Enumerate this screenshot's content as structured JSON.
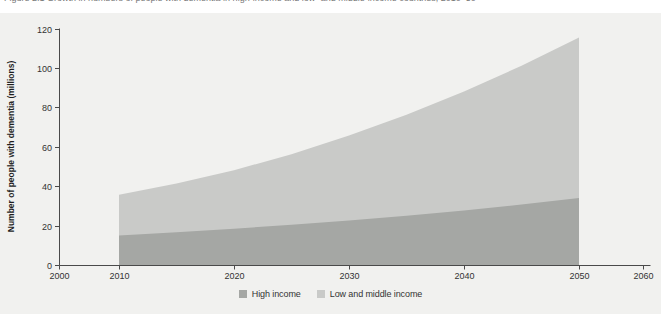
{
  "figure": {
    "clipped_caption": "Figure 2.1  Growth in numbers of people with dementia in high-income and low- and middle-income countries, 2010–50"
  },
  "chart_data": {
    "type": "area",
    "stacked": true,
    "title": "",
    "xlabel": "",
    "ylabel": "Number of people with dementia (millions)",
    "x": [
      2010,
      2015,
      2020,
      2025,
      2030,
      2035,
      2040,
      2045,
      2050
    ],
    "series": [
      {
        "name": "High income",
        "color": "#a5a7a4",
        "values": [
          15.0,
          16.6,
          18.4,
          20.4,
          22.6,
          25.0,
          27.7,
          30.7,
          34.0
        ]
      },
      {
        "name": "Low and middle income",
        "color": "#c9cac8",
        "values": [
          20.6,
          24.7,
          29.7,
          35.8,
          43.1,
          51.2,
          60.3,
          70.4,
          81.4
        ]
      }
    ],
    "totals": [
      35.6,
      41.3,
      48.1,
      56.2,
      65.7,
      76.2,
      88.0,
      101.1,
      115.4
    ],
    "x_ticks": [
      "2000",
      "2010",
      "2020",
      "2030",
      "2040",
      "2050",
      "2060"
    ],
    "y_ticks": [
      "0",
      "20",
      "40",
      "60",
      "80",
      "100",
      "120"
    ],
    "xlim": [
      2000,
      2060
    ],
    "ylim": [
      0,
      120
    ],
    "grid": false,
    "legend_position": "bottom",
    "axis_color": "#4a4a4a",
    "panel_background": "#f1f1ef"
  }
}
